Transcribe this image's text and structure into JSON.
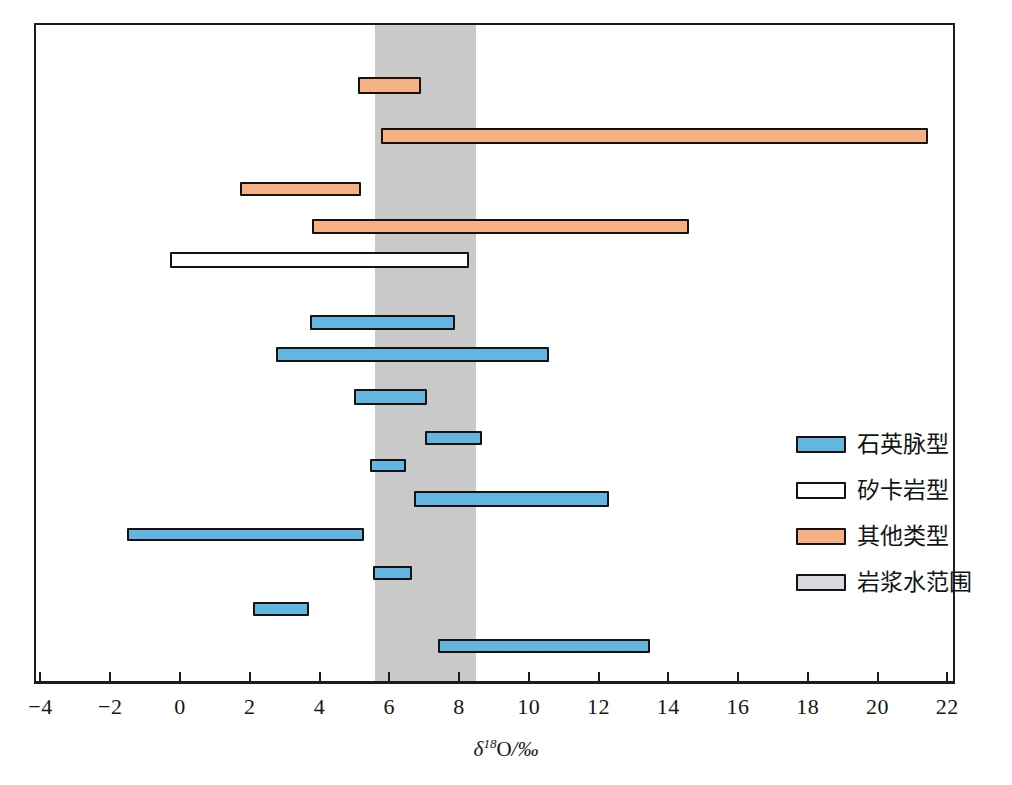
{
  "chart_data": {
    "type": "bar",
    "orientation": "horizontal-range",
    "title": "",
    "xlabel": "δ18O/‰",
    "ylabel": "",
    "xlim": [
      -4.6,
      23.2
    ],
    "xticks": [
      -4,
      -2,
      0,
      2,
      4,
      6,
      8,
      10,
      12,
      14,
      16,
      18,
      20,
      22
    ],
    "xtick_labels": [
      "−4",
      "−2",
      "0",
      "2",
      "4",
      "6",
      "8",
      "10",
      "12",
      "14",
      "16",
      "18",
      "20",
      "22"
    ],
    "grid": false,
    "legend_position": "right-middle",
    "shaded_region": {
      "label": "岩浆水范围",
      "start": 5.54,
      "end": 8.44,
      "color": "#c9c9c9"
    },
    "series": [
      {
        "name": "其他类型",
        "color": "#f5b183"
      },
      {
        "name": "矽卡岩型",
        "color": "#ffffff"
      },
      {
        "name": "石英脉型",
        "color": "#64b6e2"
      }
    ],
    "bars": [
      {
        "index": 1,
        "type": "其他类型",
        "start": 5.05,
        "end": 6.85
      },
      {
        "index": 2,
        "type": "其他类型",
        "start": 5.7,
        "end": 21.4
      },
      {
        "index": 3,
        "type": "其他类型",
        "start": 1.66,
        "end": 5.13
      },
      {
        "index": 4,
        "type": "其他类型",
        "start": 3.74,
        "end": 14.55
      },
      {
        "index": 5,
        "type": "矽卡岩型",
        "start": -0.34,
        "end": 8.23
      },
      {
        "index": 6,
        "type": "石英脉型",
        "start": 3.66,
        "end": 7.82
      },
      {
        "index": 7,
        "type": "石英脉型",
        "start": 2.7,
        "end": 10.51
      },
      {
        "index": 8,
        "type": "石英脉型",
        "start": 4.92,
        "end": 7.03
      },
      {
        "index": 9,
        "type": "石英脉型",
        "start": 6.96,
        "end": 8.6
      },
      {
        "index": 10,
        "type": "石英脉型",
        "start": 5.4,
        "end": 6.42
      },
      {
        "index": 11,
        "type": "石英脉型",
        "start": 6.64,
        "end": 12.23
      },
      {
        "index": 12,
        "type": "石英脉型",
        "start": -1.58,
        "end": 5.21
      },
      {
        "index": 13,
        "type": "石英脉型",
        "start": 5.48,
        "end": 6.59
      },
      {
        "index": 14,
        "type": "石英脉型",
        "start": 2.04,
        "end": 3.63
      },
      {
        "index": 15,
        "type": "石英脉型",
        "start": 7.34,
        "end": 13.43
      }
    ]
  },
  "axis": {
    "title_symbol": "δ",
    "title_sup": "18",
    "title_element": "O",
    "title_unit": "/‰"
  },
  "legend": {
    "items": [
      {
        "label": "石英脉型",
        "color": "#64b6e2"
      },
      {
        "label": "矽卡岩型",
        "color": "#ffffff"
      },
      {
        "label": "其他类型",
        "color": "#f5b183"
      },
      {
        "label": "岩浆水范围",
        "color": "#d7d9e0"
      }
    ]
  }
}
